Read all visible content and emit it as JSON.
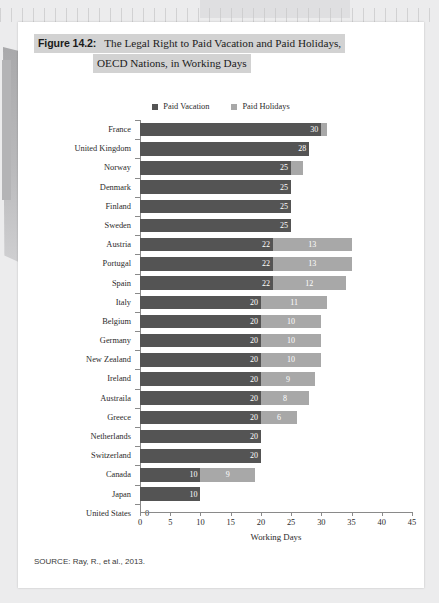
{
  "figure": {
    "number": "Figure 14.2:",
    "title_line_1": "The Legal Right to Paid Vacation and Paid Holidays,",
    "title_line_2": "OECD Nations, in Working Days"
  },
  "legend": {
    "items": [
      {
        "label": "Paid Vacation",
        "color": "#545454"
      },
      {
        "label": "Paid Holidays",
        "color": "#a8a8a8"
      }
    ]
  },
  "source_note": "SOURCE: Ray, R., et al., 2013.",
  "colors": {
    "paid_vacation": "#545454",
    "paid_holidays": "#a8a8a8",
    "axis": "#8a8a8a",
    "title_highlight": "#d2d2d2",
    "page": "#ffffff"
  },
  "chart_data": {
    "type": "bar",
    "orientation": "horizontal",
    "stacked": true,
    "title": "The Legal Right to Paid Vacation and Paid Holidays, OECD Nations, in Working Days",
    "xlabel": "Working Days",
    "ylabel": "",
    "xlim": [
      0,
      45
    ],
    "xticks": [
      0,
      5,
      10,
      15,
      20,
      25,
      30,
      35,
      40,
      45
    ],
    "grid": false,
    "legend_position": "top-center",
    "categories": [
      "France",
      "United Kingdom",
      "Norway",
      "Denmark",
      "Finland",
      "Sweden",
      "Austria",
      "Portugal",
      "Spain",
      "Italy",
      "Belgium",
      "Germany",
      "New Zealand",
      "Ireland",
      "Austraila",
      "Greece",
      "Netherlands",
      "Switzerland",
      "Canada",
      "Japan",
      "United States"
    ],
    "series": [
      {
        "name": "Paid Vacation",
        "color": "#545454",
        "values": [
          30,
          28,
          25,
          25,
          25,
          25,
          22,
          22,
          22,
          20,
          20,
          20,
          20,
          20,
          20,
          20,
          20,
          20,
          10,
          10,
          0
        ]
      },
      {
        "name": "Paid Holidays",
        "color": "#a8a8a8",
        "values": [
          1,
          0,
          2,
          0,
          0,
          0,
          13,
          13,
          12,
          11,
          10,
          10,
          10,
          9,
          8,
          6,
          0,
          0,
          9,
          0,
          0
        ]
      }
    ],
    "bar_labels": {
      "paid_vacation": [
        "30",
        "28",
        "25",
        "25",
        "25",
        "25",
        "22",
        "22",
        "22",
        "20",
        "20",
        "20",
        "20",
        "20",
        "20",
        "20",
        "20",
        "20",
        "10",
        "10",
        "0"
      ],
      "paid_holidays": [
        "",
        "",
        "",
        "",
        "",
        "",
        "13",
        "13",
        "12",
        "11",
        "10",
        "10",
        "10",
        "9",
        "8",
        "6",
        "",
        "",
        "9",
        "",
        ""
      ]
    }
  }
}
